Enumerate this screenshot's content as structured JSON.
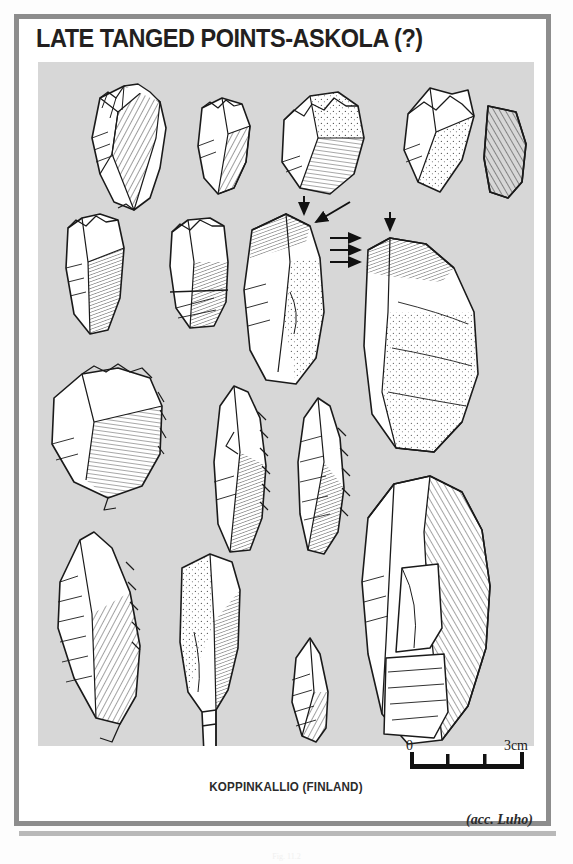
{
  "page": {
    "title": "LATE TANGED POINTS-ASKOLA (?)",
    "caption": "KOPPINKALLIO (FINLAND)",
    "attribution": "(acc. Luho)",
    "footer_fragment": "Fig. 11.2",
    "frame_color": "#8d8d8d",
    "plate_color": "#d7d7d7",
    "ink_color": "#1a1a1a"
  },
  "scale": {
    "min_label": "0",
    "max_label": "3cm",
    "ticks": 4,
    "unit": "cm",
    "length_cm": 3
  },
  "plate": {
    "kind": "archaeological-lithic-plate",
    "rows": 4,
    "artifact_count": 16,
    "artifacts": [
      {
        "id": "a1",
        "row": 1,
        "name": "tanged-point-dorsal",
        "shading": "hachure"
      },
      {
        "id": "a2",
        "row": 1,
        "name": "tanged-point-fragment",
        "shading": "hachure"
      },
      {
        "id": "a3",
        "row": 1,
        "name": "broad-flake-retouched",
        "shading": "stipple"
      },
      {
        "id": "a4",
        "row": 1,
        "name": "pointed-flake",
        "shading": "stipple"
      },
      {
        "id": "a5",
        "row": 1,
        "name": "section-profile",
        "shading": "solid-hatch"
      },
      {
        "id": "a6",
        "row": 2,
        "name": "blade-truncated",
        "shading": "hachure"
      },
      {
        "id": "a7",
        "row": 2,
        "name": "blade-snapped",
        "shading": "hachure"
      },
      {
        "id": "a8",
        "row": 2,
        "name": "large-flake-left",
        "shading": "stipple"
      },
      {
        "id": "a9",
        "row": 2,
        "name": "large-flake-right",
        "shading": "stipple"
      },
      {
        "id": "a10",
        "row": 3,
        "name": "scraper-retouched",
        "shading": "hachure"
      },
      {
        "id": "a11",
        "row": 3,
        "name": "tanged-point-slender",
        "shading": "hachure"
      },
      {
        "id": "a12",
        "row": 3,
        "name": "tanged-point-narrow",
        "shading": "hachure"
      },
      {
        "id": "a13",
        "row": 4,
        "name": "tanged-point-large",
        "shading": "hachure"
      },
      {
        "id": "a14",
        "row": 4,
        "name": "tanged-point-stemmed",
        "shading": "stipple"
      },
      {
        "id": "a15",
        "row": 4,
        "name": "small-point-fragment",
        "shading": "hachure"
      },
      {
        "id": "a16",
        "row": 4,
        "name": "blade-core",
        "shading": "hachure"
      }
    ],
    "annotations": [
      {
        "id": "a8-arrow-down",
        "type": "arrow",
        "direction": "down"
      },
      {
        "id": "a8-arrow-diagonal",
        "type": "arrow",
        "direction": "down-left"
      },
      {
        "id": "a9-arrow-right-1",
        "type": "arrow",
        "direction": "right"
      },
      {
        "id": "a9-arrow-right-2",
        "type": "arrow",
        "direction": "right"
      },
      {
        "id": "a9-arrow-right-3",
        "type": "arrow",
        "direction": "right"
      },
      {
        "id": "a9-arrow-down",
        "type": "arrow",
        "direction": "down"
      }
    ]
  }
}
